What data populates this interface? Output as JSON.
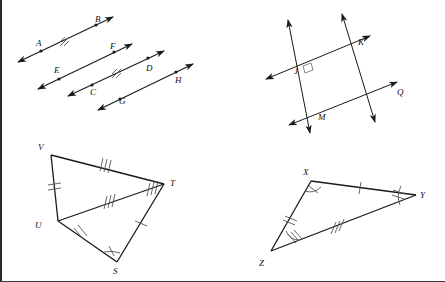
{
  "page": {
    "width": 445,
    "height": 282,
    "background": "#ffffff",
    "border_color": "#2b2b2b",
    "line_color": "#1a1a1a",
    "mark_color": "#555555"
  },
  "figures": [
    {
      "id": "parallel-lines-figure",
      "name": "four-parallel-rays-with-points",
      "type": "parallel-lines",
      "description": "Four parallel double-headed arrow lines each containing two labeled points",
      "parallel_mark_count": 2,
      "lines": [
        {
          "id": "line-AB",
          "points": [
            "A",
            "B"
          ],
          "has_parallel_mark": true
        },
        {
          "id": "line-EF",
          "points": [
            "E",
            "F"
          ],
          "has_parallel_mark": false
        },
        {
          "id": "line-CD",
          "points": [
            "C",
            "D"
          ],
          "has_parallel_mark": true
        },
        {
          "id": "line-GH",
          "points": [
            "G",
            "H"
          ],
          "has_parallel_mark": false
        }
      ],
      "labels": [
        {
          "text": "A",
          "x": 36,
          "y": 46
        },
        {
          "text": "B",
          "x": 95,
          "y": 22
        },
        {
          "text": "E",
          "x": 54,
          "y": 73
        },
        {
          "text": "F",
          "x": 110,
          "y": 49
        },
        {
          "text": "C",
          "x": 90,
          "y": 95
        },
        {
          "text": "D",
          "x": 146,
          "y": 71
        },
        {
          "text": "G",
          "x": 119,
          "y": 104
        },
        {
          "text": "H",
          "x": 175,
          "y": 83
        }
      ]
    },
    {
      "id": "parallelogram-jkqm-figure",
      "name": "parallelogram-jkqm-with-right-angle",
      "type": "parallelogram-lines",
      "description": "Two pairs of intersecting double-headed arrow lines forming quadrilateral J K Q M with a right angle marked at J",
      "right_angle_vertex": "J",
      "vertices": [
        "J",
        "K",
        "Q",
        "M"
      ],
      "labels": [
        {
          "text": "J",
          "x": 294,
          "y": 74
        },
        {
          "text": "K",
          "x": 358,
          "y": 45
        },
        {
          "text": "Q",
          "x": 397,
          "y": 95
        },
        {
          "text": "M",
          "x": 318,
          "y": 120
        }
      ]
    },
    {
      "id": "triangle-vuts-figure",
      "name": "triangle-pair-vuts",
      "type": "triangle-pair",
      "description": "Quadrilateral V T S U with diagonal U T forming two triangles; congruence tick marks on sides and angle arcs",
      "vertices": [
        "V",
        "T",
        "S",
        "U"
      ],
      "segments": [
        {
          "id": "seg-VT",
          "from": "V",
          "to": "T",
          "ticks": 3
        },
        {
          "id": "seg-VU",
          "from": "V",
          "to": "U",
          "ticks": 2
        },
        {
          "id": "seg-UT",
          "from": "U",
          "to": "T",
          "ticks": 3
        },
        {
          "id": "seg-UT-near-T",
          "from": "T",
          "to": "U",
          "ticks": 3
        },
        {
          "id": "seg-US",
          "from": "U",
          "to": "S",
          "ticks": 2
        },
        {
          "id": "seg-ST",
          "from": "S",
          "to": "T",
          "ticks": 1
        }
      ],
      "angle_marks": [
        {
          "id": "angle-S",
          "vertex": "S",
          "ticks": 1
        }
      ],
      "labels": [
        {
          "text": "V",
          "x": 38,
          "y": 150
        },
        {
          "text": "T",
          "x": 170,
          "y": 175
        },
        {
          "text": "U",
          "x": 35,
          "y": 226
        },
        {
          "text": "S",
          "x": 113,
          "y": 270
        }
      ]
    },
    {
      "id": "triangle-xyz-figure",
      "name": "triangle-xyz",
      "type": "triangle",
      "description": "Triangle X Y Z with congruence tick marks on each side and angle arcs at X, Y and Z",
      "vertices": [
        "X",
        "Y",
        "Z"
      ],
      "segments": [
        {
          "id": "seg-XY",
          "from": "X",
          "to": "Y",
          "ticks": 1
        },
        {
          "id": "seg-XZ",
          "from": "X",
          "to": "Z",
          "ticks": 2
        },
        {
          "id": "seg-ZY",
          "from": "Z",
          "to": "Y",
          "ticks": 3
        }
      ],
      "angle_marks": [
        {
          "id": "angle-X",
          "vertex": "X",
          "ticks": 1
        },
        {
          "id": "angle-Y",
          "vertex": "Y",
          "ticks": 2
        },
        {
          "id": "angle-Z",
          "vertex": "Z",
          "ticks": 3
        }
      ],
      "labels": [
        {
          "text": "X",
          "x": 303,
          "y": 172
        },
        {
          "text": "Y",
          "x": 420,
          "y": 196
        },
        {
          "text": "Z",
          "x": 259,
          "y": 264
        }
      ]
    }
  ]
}
